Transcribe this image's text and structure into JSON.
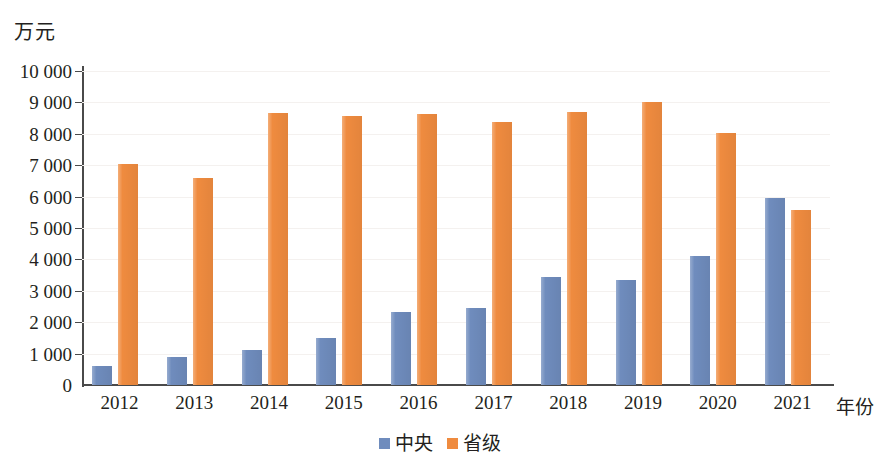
{
  "chart_data": {
    "type": "bar",
    "title": "",
    "subtitle": "",
    "xlabel": "年份",
    "ylabel": "万元",
    "ylim": [
      0,
      10000
    ],
    "ytick_step": 1000,
    "grid": true,
    "legend_position": "bottom",
    "categories": [
      "2012",
      "2013",
      "2014",
      "2015",
      "2016",
      "2017",
      "2018",
      "2019",
      "2020",
      "2021"
    ],
    "ytick_labels": [
      "0",
      "1 000",
      "2 000",
      "3 000",
      "4 000",
      "5 000",
      "6 000",
      "7 000",
      "8 000",
      "9 000",
      "10 000"
    ],
    "series": [
      {
        "name": "中央",
        "color": "#6f8cbd",
        "values": [
          600,
          900,
          1130,
          1500,
          2330,
          2450,
          3450,
          3330,
          4120,
          5960
        ]
      },
      {
        "name": "省级",
        "color": "#ef8b3f",
        "values": [
          7050,
          6600,
          8670,
          8580,
          8620,
          8380,
          8700,
          9020,
          8020,
          5580
        ]
      }
    ]
  },
  "axes": {
    "y_unit_caption": "万元",
    "x_unit_caption": "年份"
  },
  "colors": {
    "central": "#6f8cbd",
    "provincial": "#ef8b3f",
    "axis": "#4a4a4a",
    "grid": "#f4f1ef",
    "text": "#231f20"
  }
}
